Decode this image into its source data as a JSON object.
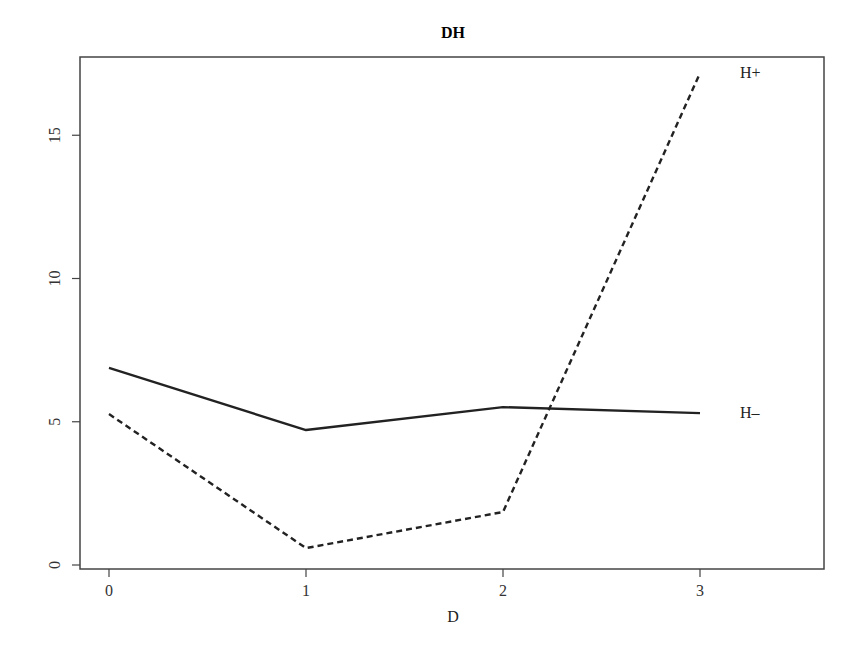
{
  "chart_data": {
    "type": "line",
    "title": "DH",
    "xlabel": "D",
    "ylabel": "",
    "x": [
      0,
      1,
      2,
      3
    ],
    "x_ticks": [
      "0",
      "1",
      "2",
      "3"
    ],
    "y_ticks": [
      "0",
      "5",
      "10",
      "15"
    ],
    "xlim": [
      -0.15,
      3.65
    ],
    "ylim": [
      -0.1,
      17.9
    ],
    "grid": false,
    "legend_position": "inline-right-labels",
    "series": [
      {
        "name": "H−",
        "label": "H–",
        "line_style": "solid",
        "color": "#222222",
        "values": [
          6.88,
          4.71,
          5.51,
          5.3
        ]
      },
      {
        "name": "H+",
        "label": "H+",
        "line_style": "dashed",
        "color": "#222222",
        "values": [
          5.27,
          0.59,
          1.85,
          17.17
        ]
      }
    ]
  }
}
